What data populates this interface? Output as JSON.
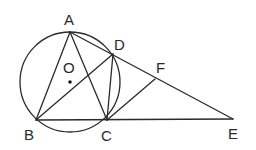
{
  "diagram": {
    "type": "geometry",
    "circle": {
      "label": "O",
      "cx": 70,
      "cy": 82,
      "r": 50
    },
    "points": {
      "A": {
        "label": "A",
        "x": 70,
        "y": 32,
        "lx": 64,
        "ly": 25
      },
      "B": {
        "label": "B",
        "x": 36,
        "y": 120,
        "lx": 24,
        "ly": 140
      },
      "C": {
        "label": "C",
        "x": 107,
        "y": 120,
        "lx": 101,
        "ly": 141
      },
      "D": {
        "label": "D",
        "x": 113,
        "y": 54,
        "lx": 114,
        "ly": 50
      },
      "F": {
        "label": "F",
        "x": 155,
        "y": 79,
        "lx": 156,
        "ly": 73
      },
      "E": {
        "label": "E",
        "x": 233,
        "y": 119,
        "lx": 228,
        "ly": 139
      },
      "O": {
        "label": "O",
        "x": 70,
        "y": 82,
        "lx": 63,
        "ly": 73
      }
    },
    "segments": [
      [
        "A",
        "B"
      ],
      [
        "A",
        "C"
      ],
      [
        "A",
        "E"
      ],
      [
        "B",
        "D"
      ],
      [
        "D",
        "C"
      ],
      [
        "C",
        "F"
      ],
      [
        "B",
        "E"
      ]
    ]
  }
}
